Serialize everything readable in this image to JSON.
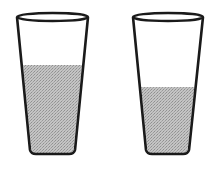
{
  "figure": {
    "colors": {
      "outline": "#1a1a1a",
      "liquid": "#b8b8b8",
      "background": "#ffffff"
    },
    "glasses": [
      {
        "name": "left-glass",
        "rim": {
          "left": 17,
          "right": 88,
          "y": 17,
          "ry": 4
        },
        "base": {
          "left": 30,
          "right": 75,
          "y": 154
        },
        "liquid_top_y": 65,
        "fill_level": "higher"
      },
      {
        "name": "right-glass",
        "rim": {
          "left": 133,
          "right": 203,
          "y": 17,
          "ry": 4
        },
        "base": {
          "left": 146,
          "right": 189,
          "y": 154
        },
        "liquid_top_y": 87,
        "fill_level": "lower"
      }
    ]
  }
}
